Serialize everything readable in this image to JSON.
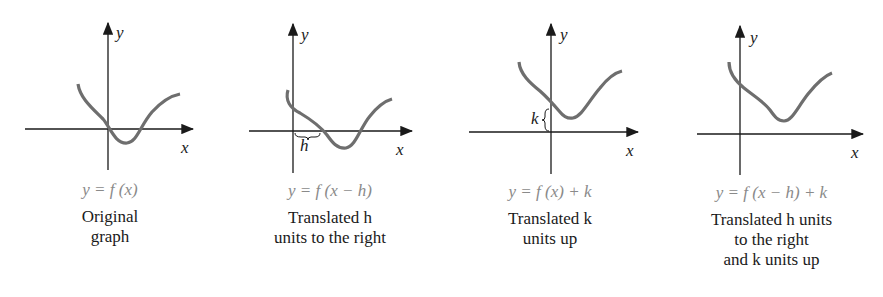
{
  "figure": {
    "colors": {
      "axis": "#1a1a1a",
      "curve": "#6e6e6e",
      "equation": "#8a8a8a",
      "caption": "#1a1a1a"
    },
    "axis_labels": {
      "x": "x",
      "y": "y"
    },
    "panels": [
      {
        "equation": "y = f (x)",
        "caption_lines": [
          "Original",
          "graph"
        ]
      },
      {
        "equation": "y = f (x − h)",
        "caption_lines": [
          "Translated h",
          "units to the right"
        ],
        "marker_label": "h"
      },
      {
        "equation": "y = f (x) + k",
        "caption_lines": [
          "Translated k",
          "units up"
        ],
        "marker_label": "k"
      },
      {
        "equation": "y = f (x − h) + k",
        "caption_lines": [
          "Translated h units",
          "to the right",
          "and k units up"
        ]
      }
    ]
  }
}
